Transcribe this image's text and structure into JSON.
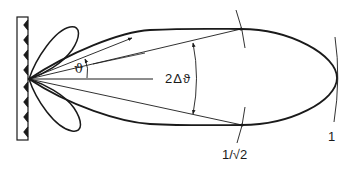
{
  "figure": {
    "labels": {
      "theta": "ϑ",
      "beamwidth": "2Δϑ",
      "half_power_level": "1/√2",
      "max_level": "1"
    },
    "elements": [
      {
        "name": "corrugated-wall",
        "teeth": 8
      },
      {
        "name": "main-lobe"
      },
      {
        "name": "upper-side-lobe"
      },
      {
        "name": "lower-side-lobe"
      },
      {
        "name": "axis-line"
      },
      {
        "name": "half-power-arc-upper"
      },
      {
        "name": "half-power-arc-lower"
      },
      {
        "name": "unit-level-arc"
      },
      {
        "name": "theta-angle-arc"
      },
      {
        "name": "beamwidth-arc"
      }
    ],
    "colors": {
      "stroke": "#1a1a1a",
      "background": "#ffffff"
    }
  }
}
